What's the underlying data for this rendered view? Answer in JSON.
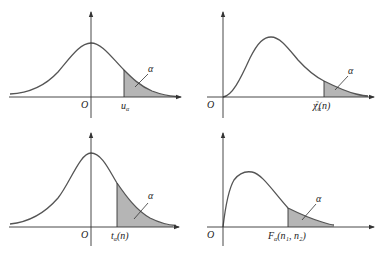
{
  "panels": [
    {
      "id": "normal",
      "origin_label": "O",
      "quantile_label": "u",
      "quantile_sub": "α",
      "quantile_rest": "",
      "tail_label": "α"
    },
    {
      "id": "chi-square",
      "origin_label": "O",
      "quantile_label": "χ",
      "quantile_sub": "α",
      "quantile_sup": "2",
      "quantile_rest": "(n)",
      "tail_label": "α"
    },
    {
      "id": "t",
      "origin_label": "O",
      "quantile_label": "t",
      "quantile_sub": "α",
      "quantile_rest": "(n)",
      "tail_label": "α"
    },
    {
      "id": "f",
      "origin_label": "O",
      "quantile_label": "F",
      "quantile_sub": "α",
      "quantile_rest": "(n₁, n₂)",
      "tail_label": "α"
    }
  ],
  "colors": {
    "curve": "#555555",
    "axis": "#333333",
    "tail_fill": "#b5b5b5"
  }
}
